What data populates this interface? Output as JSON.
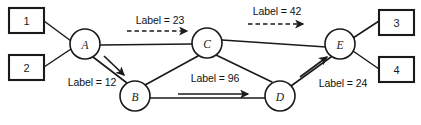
{
  "diagram": {
    "type": "node-link-graph",
    "canvas": {
      "width": 421,
      "height": 125,
      "background": "#ffffff"
    },
    "stroke_color": "#1a1a1a",
    "endpoints": [
      {
        "id": "ep1",
        "label": "1",
        "shape": "rectangle",
        "x": 9,
        "y": 8,
        "w": 35,
        "h": 25
      },
      {
        "id": "ep2",
        "label": "2",
        "shape": "rectangle",
        "x": 9,
        "y": 55,
        "w": 35,
        "h": 25
      },
      {
        "id": "ep3",
        "label": "3",
        "shape": "rectangle",
        "x": 379,
        "y": 10,
        "w": 35,
        "h": 25
      },
      {
        "id": "ep4",
        "label": "4",
        "shape": "rectangle",
        "x": 379,
        "y": 57,
        "w": 35,
        "h": 25
      }
    ],
    "nodes": [
      {
        "id": "A",
        "label": "A",
        "shape": "circle",
        "cx": 85,
        "cy": 44,
        "r": 15
      },
      {
        "id": "B",
        "label": "B",
        "shape": "circle",
        "cx": 135,
        "cy": 96,
        "r": 15
      },
      {
        "id": "C",
        "label": "C",
        "shape": "circle",
        "cx": 207,
        "cy": 43,
        "r": 15
      },
      {
        "id": "D",
        "label": "D",
        "shape": "circle",
        "cx": 280,
        "cy": 96,
        "r": 15
      },
      {
        "id": "E",
        "label": "E",
        "shape": "circle",
        "cx": 340,
        "cy": 44,
        "r": 15
      }
    ],
    "endpoint_links": [
      {
        "from": "ep1",
        "to": "A",
        "x1": 44,
        "y1": 21,
        "x2": 71,
        "y2": 41
      },
      {
        "from": "ep2",
        "to": "A",
        "x1": 44,
        "y1": 67,
        "x2": 71,
        "y2": 49
      },
      {
        "from": "E",
        "to": "ep3",
        "x1": 353,
        "y1": 38,
        "x2": 379,
        "y2": 21
      },
      {
        "from": "E",
        "to": "ep4",
        "x1": 353,
        "y1": 51,
        "x2": 379,
        "y2": 69
      }
    ],
    "edges": [
      {
        "id": "ac",
        "from": "A",
        "to": "C",
        "x1": 100,
        "y1": 45,
        "x2": 192,
        "y2": 44
      },
      {
        "id": "ab",
        "from": "A",
        "to": "B",
        "x1": 93,
        "y1": 57,
        "x2": 127,
        "y2": 83
      },
      {
        "id": "bc",
        "from": "B",
        "to": "C",
        "x1": 145,
        "y1": 85,
        "x2": 198,
        "y2": 56
      },
      {
        "id": "bd",
        "from": "B",
        "to": "D",
        "x1": 150,
        "y1": 98,
        "x2": 265,
        "y2": 98
      },
      {
        "id": "cd",
        "from": "C",
        "to": "D",
        "x1": 216,
        "y1": 55,
        "x2": 272,
        "y2": 82
      },
      {
        "id": "ce",
        "from": "C",
        "to": "E",
        "x1": 222,
        "y1": 40,
        "x2": 326,
        "y2": 47
      },
      {
        "id": "de",
        "from": "D",
        "to": "E",
        "x1": 291,
        "y1": 86,
        "x2": 331,
        "y2": 57
      }
    ],
    "edge_labels": [
      {
        "id": "label-23",
        "text": "Label = 23",
        "for_edge": "ac",
        "x": 160,
        "y": 20
      },
      {
        "id": "label-42",
        "text": "Label = 42",
        "for_edge": "ce",
        "x": 277,
        "y": 11
      },
      {
        "id": "label-12",
        "text": "Label = 12",
        "for_edge": "ab",
        "x": 92,
        "y": 82
      },
      {
        "id": "label-96",
        "text": "Label = 96",
        "for_edge": "bd",
        "x": 215,
        "y": 78
      },
      {
        "id": "label-24",
        "text": "Label = 24",
        "for_edge": "de",
        "x": 343,
        "y": 83
      }
    ],
    "direction_arrows": [
      {
        "id": "arrow-23",
        "style": "dashed",
        "for_edge": "ac",
        "x1": 127,
        "y1": 31,
        "x2": 187,
        "y2": 31
      },
      {
        "id": "arrow-42",
        "style": "dashed",
        "for_edge": "ce",
        "x1": 248,
        "y1": 24,
        "x2": 303,
        "y2": 24
      },
      {
        "id": "arrow-12",
        "style": "solid",
        "for_edge": "ab",
        "x1": 104,
        "y1": 56,
        "x2": 124,
        "y2": 75
      },
      {
        "id": "arrow-96",
        "style": "solid",
        "for_edge": "bd",
        "x1": 178,
        "y1": 94,
        "x2": 248,
        "y2": 94
      },
      {
        "id": "arrow-24",
        "style": "solid",
        "for_edge": "de",
        "x1": 300,
        "y1": 77,
        "x2": 327,
        "y2": 57
      }
    ]
  }
}
